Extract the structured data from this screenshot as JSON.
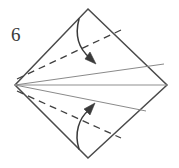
{
  "figure": {
    "kind": "origami-fold-diagram",
    "step_number": "6",
    "background_color": "#ffffff",
    "outline_color": "#4a4a4a",
    "crease_color": "#8a8a8a",
    "dash_color": "#3f3f3f",
    "arrow_color": "#3a3a3a",
    "label_color": "#3a3a3a"
  },
  "shape": {
    "name": "kite-diamond",
    "vertices": {
      "top": [
        88,
        9
      ],
      "right": [
        167,
        85
      ],
      "bottom": [
        88,
        158
      ],
      "left": [
        15,
        85
      ]
    }
  },
  "creases": [
    {
      "name": "horizontal-center-crease",
      "style": "solid",
      "from": [
        15,
        85
      ],
      "to": [
        167,
        85
      ]
    },
    {
      "name": "upper-existing-crease",
      "style": "solid",
      "from": [
        15,
        85
      ],
      "to": [
        164,
        64
      ]
    },
    {
      "name": "lower-existing-crease",
      "style": "solid",
      "from": [
        15,
        85
      ],
      "to": [
        146,
        111
      ]
    }
  ],
  "fold_lines": [
    {
      "name": "upper-valley-fold",
      "style": "dashed",
      "from": [
        17,
        79
      ],
      "to": [
        121,
        30
      ]
    },
    {
      "name": "lower-valley-fold",
      "style": "dashed",
      "from": [
        17,
        91
      ],
      "to": [
        121,
        138
      ]
    }
  ],
  "arrows": [
    {
      "name": "upper-fold-arrow",
      "direction": "down",
      "from": [
        79,
        19
      ],
      "to": [
        95,
        62
      ],
      "description": "fold top edge down to center"
    },
    {
      "name": "lower-fold-arrow",
      "direction": "up",
      "from": [
        79,
        148
      ],
      "to": [
        93,
        105
      ],
      "description": "fold bottom edge up to center"
    }
  ]
}
